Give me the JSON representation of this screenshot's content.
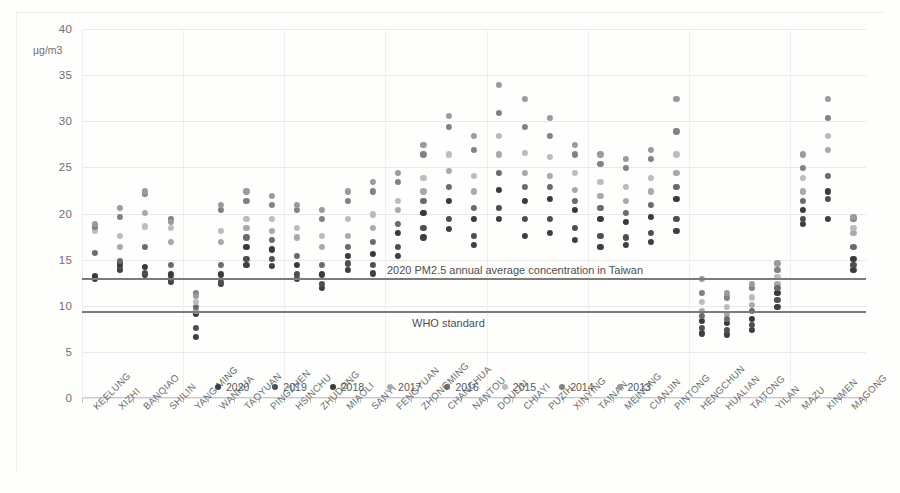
{
  "chart_data": {
    "type": "scatter",
    "title": "",
    "xlabel": "",
    "ylabel": "µg/m3",
    "ylim": [
      0,
      40
    ],
    "ytick_step": 5,
    "yticks": [
      0,
      5,
      10,
      15,
      20,
      25,
      30,
      35,
      40
    ],
    "grid": true,
    "legend_position": "bottom",
    "categories": [
      "KEELUNG",
      "XIZHI",
      "BANQIAO",
      "SHILIN",
      "YANG MING",
      "WANHUA",
      "TAOYUAN",
      "PINGZHEN",
      "HSINCHU",
      "ZHUDONG",
      "MIAOLI",
      "SANYI",
      "FENGYUAN",
      "ZHONGMING",
      "CHANGHUA",
      "NANTOU",
      "DOULIU",
      "CHIAYI",
      "PUZIH",
      "XINYING",
      "TAINAN",
      "MEINONG",
      "CIANJIN",
      "PINTONG",
      "HENGCHUN",
      "HUALIAN",
      "TAITONG",
      "YILAN",
      "MAZU",
      "KINMEN",
      "MAGONG"
    ],
    "series": [
      {
        "name": "2020",
        "color": "#3f3f41",
        "values": [
          12.9,
          13.9,
          13.4,
          12.6,
          6.6,
          12.4,
          14.4,
          14.3,
          12.9,
          11.9,
          13.9,
          13.5,
          15.4,
          17.4,
          18.3,
          16.6,
          19.4,
          17.6,
          17.9,
          17.1,
          16.4,
          16.6,
          16.9,
          18.1,
          7.0,
          6.9,
          7.4,
          9.9,
          18.9,
          19.4,
          13.9
        ]
      },
      {
        "name": "2019",
        "color": "#4f4f52",
        "values": [
          13.1,
          14.2,
          13.6,
          12.9,
          7.6,
          12.6,
          15.1,
          15.1,
          13.4,
          12.4,
          14.6,
          14.4,
          16.4,
          18.4,
          19.4,
          17.6,
          20.6,
          19.4,
          19.4,
          18.4,
          17.6,
          17.4,
          17.9,
          19.4,
          7.6,
          7.4,
          7.9,
          10.6,
          19.4,
          21.6,
          14.4
        ]
      },
      {
        "name": "2018",
        "color": "#3a3a3c",
        "values": [
          13.2,
          14.6,
          14.2,
          13.4,
          9.1,
          13.4,
          16.4,
          16.1,
          14.4,
          13.4,
          15.4,
          15.6,
          17.9,
          20.1,
          21.4,
          19.4,
          22.6,
          21.4,
          21.6,
          20.4,
          19.4,
          19.1,
          19.6,
          21.6,
          8.4,
          8.1,
          8.6,
          11.4,
          20.4,
          22.4,
          15.1
        ]
      },
      {
        "name": "2017",
        "color": "#a9a9ac",
        "values": [
          18.4,
          16.4,
          20.1,
          16.9,
          9.4,
          16.9,
          18.4,
          18.1,
          17.4,
          16.4,
          17.6,
          18.4,
          20.4,
          22.4,
          24.6,
          22.4,
          26.4,
          24.4,
          24.1,
          22.6,
          21.9,
          21.4,
          22.4,
          24.4,
          9.4,
          9.1,
          10.1,
          12.4,
          22.4,
          26.9,
          17.9
        ]
      },
      {
        "name": "2016",
        "color": "#6b6b6e",
        "values": [
          15.7,
          14.9,
          16.4,
          14.4,
          9.9,
          14.4,
          17.4,
          17.1,
          15.4,
          14.4,
          16.4,
          16.9,
          18.9,
          21.4,
          22.9,
          20.6,
          24.4,
          22.9,
          22.9,
          21.4,
          20.6,
          20.1,
          20.9,
          22.9,
          8.9,
          8.6,
          9.4,
          11.9,
          21.4,
          24.1,
          16.4
        ]
      },
      {
        "name": "2015",
        "color": "#bcbcbf",
        "values": [
          18.1,
          17.6,
          18.6,
          18.4,
          10.4,
          18.1,
          19.4,
          19.4,
          18.4,
          17.6,
          19.4,
          19.9,
          21.4,
          23.9,
          26.4,
          24.1,
          28.4,
          26.6,
          26.1,
          24.4,
          23.4,
          22.9,
          23.9,
          26.4,
          10.4,
          9.9,
          10.9,
          13.1,
          23.9,
          28.4,
          18.4
        ]
      },
      {
        "name": "2014",
        "color": "#828285",
        "values": [
          18.6,
          19.6,
          22.1,
          19.4,
          11.4,
          20.4,
          21.4,
          20.9,
          20.4,
          19.4,
          21.4,
          22.4,
          23.4,
          26.4,
          29.4,
          26.9,
          30.9,
          29.4,
          28.4,
          26.4,
          25.4,
          24.9,
          25.9,
          28.9,
          11.4,
          10.9,
          11.9,
          13.9,
          24.9,
          30.4,
          19.4
        ]
      },
      {
        "name": "2013",
        "color": "#9b9b9e",
        "values": [
          18.9,
          20.6,
          22.4,
          19.1,
          11.1,
          20.9,
          22.4,
          21.9,
          20.9,
          20.4,
          22.4,
          23.4,
          24.4,
          27.4,
          30.6,
          28.4,
          33.9,
          32.4,
          30.4,
          27.4,
          26.4,
          25.9,
          26.9,
          32.4,
          12.9,
          11.4,
          12.4,
          14.6,
          26.4,
          32.4,
          19.6
        ]
      }
    ],
    "reference_lines": [
      {
        "label": "2020 PM2.5 annual average concentration in Taiwan",
        "value": 13.0,
        "color": "#7b7b7c"
      },
      {
        "label": "WHO standard",
        "value": 9.4,
        "color": "#7b7b7c"
      }
    ]
  }
}
